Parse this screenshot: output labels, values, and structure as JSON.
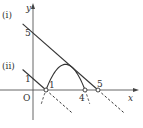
{
  "diagram": {
    "axes": {
      "x_label": "x",
      "y_label": "y",
      "origin_label": "O",
      "x_ticks": [
        "1",
        "4",
        "5"
      ],
      "y_ticks": [
        "1",
        "5"
      ],
      "x_tick_values": [
        1,
        4,
        5
      ],
      "y_tick_values": [
        1,
        5
      ]
    },
    "curves": [
      {
        "name": "parabola",
        "equation": "y = -(x-1)(x-4)",
        "a": -1,
        "roots": [
          1,
          4
        ],
        "solid_domain": [
          1,
          4
        ]
      },
      {
        "name": "line-i",
        "label": "(i)",
        "slope": -1,
        "intercept": 5,
        "solid_domain": [
          -0.8,
          5
        ]
      },
      {
        "name": "line-ii",
        "label": "(ii)",
        "slope": -1,
        "intercept": 1,
        "solid_domain": [
          -0.8,
          1
        ]
      }
    ],
    "open_points": [
      [
        1,
        0
      ],
      [
        4,
        0
      ],
      [
        5,
        0
      ]
    ],
    "x_range": [
      -1.2,
      7.8
    ],
    "y_range": [
      -3.3,
      7.0
    ]
  }
}
